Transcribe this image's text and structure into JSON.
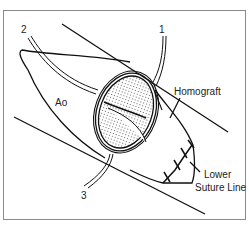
{
  "diagram": {
    "labels": {
      "suture_1": "1",
      "suture_2": "2",
      "suture_3": "3",
      "aorta": "Ao",
      "homograft": "Homograft",
      "lower_suture_line_1": "Lower",
      "lower_suture_line_2": "Suture Line"
    },
    "colors": {
      "stroke": "#111111",
      "frame": "#8a8a8a",
      "stipple": "#555555"
    }
  }
}
